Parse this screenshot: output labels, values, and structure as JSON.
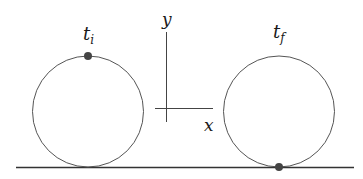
{
  "diagram": {
    "type": "rolling-wheel",
    "labels": {
      "initial_time": "t",
      "initial_time_sub": "i",
      "final_time": "t",
      "final_time_sub": "f",
      "x_axis": "x",
      "y_axis": "y"
    },
    "colors": {
      "line": "#4a4a4a",
      "ground": "#333333",
      "point": "#444444"
    },
    "wheels": [
      {
        "name": "initial",
        "point_position": "top"
      },
      {
        "name": "final",
        "point_position": "bottom"
      }
    ]
  }
}
